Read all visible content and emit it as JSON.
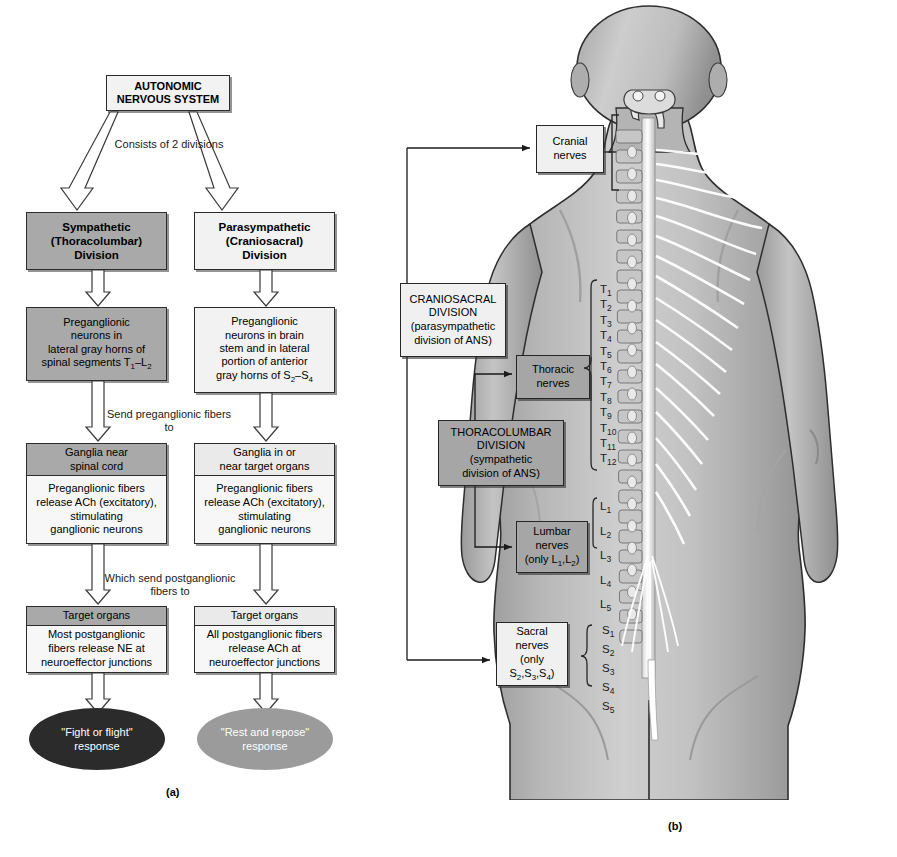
{
  "figure": {
    "panel_a_caption": "(a)",
    "panel_b_caption": "(b)"
  },
  "flowchart": {
    "title_box": {
      "line1": "AUTONOMIC",
      "line2": "NERVOUS SYSTEM"
    },
    "connector_top": "Consists of 2 divisions",
    "connector_mid": {
      "line1": "Send preganglionic",
      "line2": "fibers to"
    },
    "connector_low": {
      "line1": "Which send postganglionic",
      "line2": "fibers to"
    },
    "sympathetic": {
      "division": {
        "line1": "Sympathetic",
        "line2": "(Thoracolumbar)",
        "line3": "Division"
      },
      "preganglionic": {
        "line1": "Preganglionic",
        "line2": "neurons in",
        "line3": "lateral gray horns of",
        "line4": "spinal segments T1–L2"
      },
      "ganglia_header": {
        "line1": "Ganglia near",
        "line2": "spinal cord"
      },
      "ganglia_body": {
        "line1": "Preganglionic fibers",
        "line2": "release ACh (excitatory),",
        "line3": "stimulating",
        "line4": "ganglionic neurons"
      },
      "target_header": "Target organs",
      "target_body": {
        "line1": "Most postganglionic",
        "line2": "fibers release NE at",
        "line3": "neuroeffector junctions"
      },
      "response": {
        "line1": "\"Fight or flight\"",
        "line2": "response"
      }
    },
    "parasympathetic": {
      "division": {
        "line1": "Parasympathetic",
        "line2": "(Craniosacral)",
        "line3": "Division"
      },
      "preganglionic": {
        "line1": "Preganglionic",
        "line2": "neurons in brain",
        "line3": "stem and in lateral",
        "line4": "portion of anterior",
        "line5": "gray horns of S2–S4"
      },
      "ganglia_header": {
        "line1": "Ganglia in or",
        "line2": "near target organs"
      },
      "ganglia_body": {
        "line1": "Preganglionic fibers",
        "line2": "release ACh (excitatory),",
        "line3": "stimulating",
        "line4": "ganglionic neurons"
      },
      "target_header": "Target organs",
      "target_body": {
        "line1": "All postganglionic fibers",
        "line2": "release ACh at",
        "line3": "neuroeffector junctions"
      },
      "response": {
        "line1": "\"Rest and repose\"",
        "line2": "response"
      }
    }
  },
  "anatomy": {
    "cranial_nerves": {
      "line1": "Cranial",
      "line2": "nerves"
    },
    "craniosacral_division": {
      "line1": "CRANIOSACRAL",
      "line2": "DIVISION",
      "line3": "(parasympathetic",
      "line4": "division of ANS)"
    },
    "thoracic_nerves": {
      "line1": "Thoracic",
      "line2": "nerves"
    },
    "thoracolumbar_division": {
      "line1": "THORACOLUMBAR",
      "line2": "DIVISION",
      "line3": "(sympathetic",
      "line4": "division of ANS)"
    },
    "lumbar_nerves": {
      "line1": "Lumbar",
      "line2": "nerves",
      "line3": "(only L1 L2)"
    },
    "sacral_nerves": {
      "line1": "Sacral",
      "line2": "nerves",
      "line3": "(only",
      "line4": "S2 S3 S4)"
    },
    "vertebral_labels": {
      "thoracic": [
        "T1",
        "T2",
        "T3",
        "T4",
        "T5",
        "T6",
        "T7",
        "T8",
        "T9",
        "T10",
        "T11",
        "T12"
      ],
      "lumbar": [
        "L1",
        "L2",
        "L3",
        "L4",
        "L5"
      ],
      "sacral": [
        "S1",
        "S2",
        "S3",
        "S4",
        "S5"
      ]
    }
  },
  "colors": {
    "sympathetic_fill": "#a9a9a9",
    "parasympathetic_fill": "#f2f2f2",
    "fight_flight_fill": "#2b2b2b",
    "rest_repose_fill": "#9b9b9b",
    "outline": "#262626",
    "skin": "#b9b9b9"
  }
}
